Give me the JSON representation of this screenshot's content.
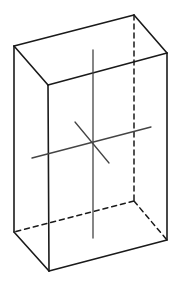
{
  "diagram": {
    "type": "rectangular-prism-with-axes",
    "stroke_color": "#1a1a1a",
    "axis_color": "#444444",
    "background": "#ffffff",
    "vertices": {
      "back_top_left": [
        14,
        46
      ],
      "back_top_right": [
        134,
        15
      ],
      "front_top_right": [
        167,
        53
      ],
      "front_top_left": [
        48,
        85
      ],
      "back_bottom_left": [
        14,
        232
      ],
      "front_bottom_left": [
        49,
        271
      ],
      "front_bottom_right": [
        167,
        240
      ],
      "back_bottom_right": [
        134,
        201
      ]
    },
    "solid_edges": [
      [
        "back_top_left",
        "back_top_right"
      ],
      [
        "back_top_right",
        "front_top_right"
      ],
      [
        "front_top_right",
        "front_top_left"
      ],
      [
        "front_top_left",
        "back_top_left"
      ],
      [
        "back_top_left",
        "back_bottom_left"
      ],
      [
        "front_top_left",
        "front_bottom_left"
      ],
      [
        "front_top_right",
        "front_bottom_right"
      ],
      [
        "back_bottom_left",
        "front_bottom_left"
      ],
      [
        "front_bottom_left",
        "front_bottom_right"
      ]
    ],
    "dashed_edges": [
      [
        "back_top_right",
        "back_bottom_right"
      ],
      [
        "back_bottom_right",
        "back_bottom_left"
      ],
      [
        "back_bottom_right",
        "front_bottom_right"
      ]
    ],
    "axes": [
      {
        "name": "vertical-axis",
        "from": [
          93,
          50
        ],
        "to": [
          93,
          238
        ]
      },
      {
        "name": "horizontal-axis",
        "from": [
          32,
          158
        ],
        "to": [
          151,
          127
        ]
      },
      {
        "name": "depth-axis",
        "from": [
          75,
          122
        ],
        "to": [
          109,
          163
        ]
      }
    ]
  }
}
